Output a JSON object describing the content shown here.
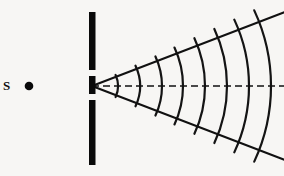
{
  "figure": {
    "width": 284,
    "height": 176,
    "background_color": "#f7f6f4",
    "ink_color": "#111111"
  },
  "source": {
    "label": "S",
    "label_x": 3,
    "label_y": 79,
    "dot_name": "point-source-dot",
    "dot_cx": 29,
    "dot_cy": 86,
    "dot_r": 4.3
  },
  "barrier": {
    "name": "opaque-barrier",
    "x": 89,
    "width": 6.5,
    "color": "#0a0a0a",
    "segments": [
      {
        "y": 12,
        "height": 58
      },
      {
        "y": 76,
        "height": 18
      },
      {
        "y": 100,
        "height": 65
      }
    ]
  },
  "slit": {
    "name": "slit-aperture",
    "apex_x": 92,
    "apex_y": 86,
    "upper_gap_y": 70,
    "upper_gap_height": 6,
    "lower_gap_y": 94,
    "lower_gap_height": 6
  },
  "axis": {
    "name": "central-axis",
    "style": "dashed",
    "x1": 92,
    "y1": 86,
    "x2": 284,
    "y2": 86,
    "dash_pattern": "7,4"
  },
  "cone": {
    "half_angle_degrees": 21,
    "rays": [
      {
        "name": "upper-boundary-ray",
        "angle_degrees": -21
      },
      {
        "name": "lower-boundary-ray",
        "angle_degrees": 21
      }
    ]
  },
  "chart_data": {
    "type": "line",
    "xlabel": "",
    "ylabel": "",
    "xlim": [
      0,
      284
    ],
    "ylim": [
      0,
      176
    ],
    "grid": false,
    "legend_position": "none",
    "annotations": [
      {
        "text": "S",
        "x": 5,
        "y": 86,
        "note": "point source label"
      }
    ],
    "series": [
      {
        "name": "wavefront-arcs",
        "kind": "concentric-circular-arcs",
        "center": [
          92,
          86
        ],
        "radii": [
          26,
          48,
          70,
          91,
          113,
          135,
          157,
          179
        ],
        "arc_half_angle_degrees": 25,
        "count": 8
      },
      {
        "name": "boundary-rays",
        "kind": "radial-lines",
        "origin": [
          92,
          86
        ],
        "angles_degrees": [
          -21,
          21
        ],
        "length": 206
      },
      {
        "name": "central-axis",
        "kind": "dashed-line",
        "x": [
          92,
          284
        ],
        "y": [
          86,
          86
        ]
      }
    ]
  }
}
